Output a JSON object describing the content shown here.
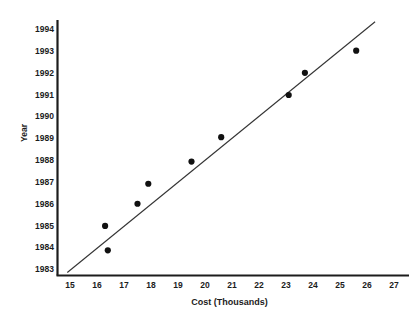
{
  "chart_data": {
    "type": "scatter",
    "title": "",
    "xlabel": "Cost (Thousands)",
    "ylabel": "Year",
    "xlim": [
      15,
      27
    ],
    "ylim": [
      1983,
      1994
    ],
    "grid": false,
    "legend": null,
    "x_ticks": [
      "15",
      "16",
      "17",
      "18",
      "19",
      "20",
      "21",
      "22",
      "23",
      "24",
      "25",
      "26",
      "27"
    ],
    "y_ticks": [
      "1983",
      "1984",
      "1985",
      "1986",
      "1987",
      "1988",
      "1989",
      "1990",
      "1991",
      "1992",
      "1993",
      "1994"
    ],
    "x": [
      16.3,
      16.4,
      17.5,
      17.9,
      19.5,
      20.6,
      23.1,
      23.7,
      25.6
    ],
    "y": [
      1984.9,
      1983.8,
      1985.9,
      1986.8,
      1987.8,
      1988.9,
      1990.8,
      1991.8,
      1992.8
    ],
    "points": [
      {
        "cost": 16.3,
        "year": 1984.9
      },
      {
        "cost": 16.4,
        "year": 1983.8
      },
      {
        "cost": 17.5,
        "year": 1985.9
      },
      {
        "cost": 17.9,
        "year": 1986.8
      },
      {
        "cost": 19.5,
        "year": 1987.8
      },
      {
        "cost": 20.6,
        "year": 1988.9
      },
      {
        "cost": 23.1,
        "year": 1990.8
      },
      {
        "cost": 23.7,
        "year": 1991.8
      },
      {
        "cost": 25.6,
        "year": 1992.8
      }
    ],
    "series": [
      {
        "name": "observations",
        "marker": "filled-circle",
        "color": "#111111",
        "values": [
          1984.9,
          1983.8,
          1985.9,
          1986.8,
          1987.8,
          1988.9,
          1990.8,
          1991.8,
          1992.8
        ]
      },
      {
        "name": "trend-line",
        "type": "line",
        "color": "#333333",
        "endpoints": [
          {
            "cost": 14.9,
            "year": 1982.8
          },
          {
            "cost": 26.3,
            "year": 1994.1
          }
        ]
      }
    ],
    "colors": {
      "marker": "#111111",
      "line": "#333333",
      "axis": "#1c1c1c",
      "text": "#1c1c1c",
      "background": "#ffffff"
    }
  }
}
